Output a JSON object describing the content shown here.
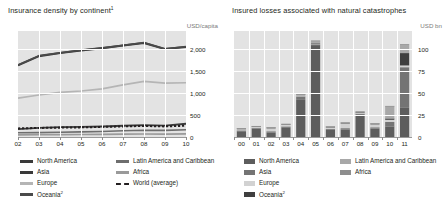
{
  "chart_data": [
    {
      "type": "line",
      "title": "Insurance density by continent",
      "title_sup": "1",
      "ylabel": "USD/capita",
      "xlabel": "",
      "x": [
        "02",
        "03",
        "04",
        "05",
        "06",
        "07",
        "08",
        "09",
        "10"
      ],
      "yticks": [
        0,
        500,
        1000,
        1500,
        2000
      ],
      "ytick_labels": [
        "0",
        "500",
        "1,000",
        "1,500",
        "2,000"
      ],
      "ylim": [
        0,
        2400
      ],
      "grid": true,
      "legend_position": "below",
      "series": [
        {
          "name": "North America",
          "color": "#3a3a3a",
          "style": "solid",
          "width": 2.0,
          "values": [
            1620,
            1830,
            1900,
            1960,
            2010,
            2070,
            2130,
            1990,
            2040
          ]
        },
        {
          "name": "Europe",
          "color": "#b5b5b5",
          "style": "solid",
          "width": 1.6,
          "values": [
            880,
            950,
            1010,
            1040,
            1090,
            1180,
            1260,
            1220,
            1230
          ]
        },
        {
          "name": "Asia",
          "color": "#3a3a3a",
          "style": "solid",
          "width": 1.8,
          "values": [
            180,
            205,
            222,
            228,
            238,
            255,
            268,
            258,
            300
          ]
        },
        {
          "name": "Oceania",
          "color": "#4a4a4a",
          "style": "solid",
          "width": 1.8,
          "values": [
            1630,
            1840,
            1905,
            1965,
            2015,
            2075,
            2135,
            1995,
            2045
          ]
        },
        {
          "name": "World (average)",
          "color": "#231f20",
          "style": "dashed",
          "width": 2.0,
          "values": [
            195,
            205,
            212,
            218,
            228,
            240,
            250,
            240,
            255
          ]
        },
        {
          "name": "Latin America and Caribbean",
          "color": "#6e6e6e",
          "style": "solid",
          "width": 1.6,
          "values": [
            95,
            100,
            108,
            115,
            126,
            140,
            152,
            150,
            165
          ]
        },
        {
          "name": "Africa",
          "color": "#9a9a9a",
          "style": "solid",
          "width": 1.6,
          "values": [
            48,
            50,
            54,
            57,
            60,
            64,
            68,
            66,
            70
          ]
        }
      ]
    },
    {
      "type": "bar",
      "title": "Insured losses associated with natural catastrophes",
      "title_sup": "",
      "ylabel": "USD bn",
      "xlabel": "",
      "categories": [
        "00",
        "01",
        "02",
        "03",
        "04",
        "05",
        "06",
        "07",
        "08",
        "09",
        "10",
        "11"
      ],
      "yticks": [
        0,
        25,
        50,
        75,
        100
      ],
      "ytick_labels": [
        "0",
        "25",
        "50",
        "75",
        "100"
      ],
      "ylim": [
        0,
        120
      ],
      "grid": true,
      "stacked": true,
      "legend_position": "below",
      "series": [
        {
          "name": "North America",
          "color": "#5d5d5d",
          "values": [
            6.5,
            9.5,
            5.0,
            11.0,
            42.0,
            104.0,
            8.0,
            8.5,
            25.0,
            9.5,
            12.0,
            33.0
          ]
        },
        {
          "name": "Asia",
          "color": "#747474",
          "values": [
            1.0,
            1.0,
            1.5,
            1.0,
            4.0,
            1.0,
            1.0,
            1.5,
            1.5,
            1.5,
            5.0,
            46.0
          ]
        },
        {
          "name": "Europe",
          "color": "#d2d2d2",
          "values": [
            1.5,
            1.0,
            3.5,
            2.0,
            1.5,
            1.0,
            2.0,
            5.5,
            1.0,
            3.5,
            2.5,
            2.0
          ]
        },
        {
          "name": "Oceania",
          "color": "#3f3f3f",
          "values": [
            0.5,
            0.5,
            0.5,
            0.5,
            0.5,
            0.5,
            0.5,
            0.5,
            0.5,
            0.5,
            1.5,
            14.0
          ]
        },
        {
          "name": "Latin America and Caribbean",
          "color": "#a8a8a8",
          "values": [
            0.3,
            0.3,
            0.3,
            0.3,
            0.5,
            2.5,
            0.3,
            0.3,
            0.8,
            0.3,
            14.0,
            10.0
          ]
        },
        {
          "name": "Africa",
          "color": "#8e8e8e",
          "values": [
            0.2,
            0.2,
            0.2,
            0.2,
            0.2,
            0.2,
            0.2,
            0.2,
            0.2,
            0.2,
            0.2,
            0.3
          ]
        }
      ]
    }
  ],
  "left_chart": {
    "title": "Insurance density by continent",
    "title_superscript": "1",
    "unit": "USD/capita",
    "legend": {
      "col1": [
        {
          "label": "North America",
          "color": "#3a3a3a",
          "style": "solid",
          "sup": ""
        },
        {
          "label": "Asia",
          "color": "#3a3a3a",
          "style": "solid",
          "sup": ""
        },
        {
          "label": "Europe",
          "color": "#b5b5b5",
          "style": "solid",
          "sup": ""
        },
        {
          "label": "Oceania",
          "color": "#4a4a4a",
          "style": "solid",
          "sup": "2"
        }
      ],
      "col2": [
        {
          "label": "Latin America and Caribbean",
          "color": "#6e6e6e",
          "style": "solid",
          "sup": ""
        },
        {
          "label": "Africa",
          "color": "#9a9a9a",
          "style": "solid",
          "sup": ""
        },
        {
          "label": "World (average)",
          "color": "#231f20",
          "style": "dashed",
          "sup": ""
        }
      ]
    }
  },
  "right_chart": {
    "title": "Insured losses associated with natural catastrophes",
    "unit": "USD bn",
    "legend": {
      "col1": [
        {
          "label": "North America",
          "color": "#5d5d5d",
          "sup": ""
        },
        {
          "label": "Asia",
          "color": "#747474",
          "sup": ""
        },
        {
          "label": "Europe",
          "color": "#d2d2d2",
          "sup": ""
        },
        {
          "label": "Oceania",
          "color": "#3f3f3f",
          "sup": "2"
        }
      ],
      "col2": [
        {
          "label": "Latin America and Caribbean",
          "color": "#a8a8a8",
          "sup": ""
        },
        {
          "label": "Africa",
          "color": "#8e8e8e",
          "sup": ""
        }
      ]
    }
  }
}
